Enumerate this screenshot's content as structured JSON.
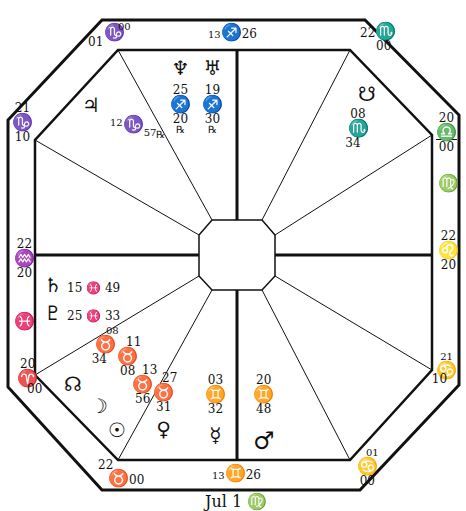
{
  "chart": {
    "colors": {
      "ink": "#111111",
      "paper": "#ffffff"
    }
  },
  "cusps": {
    "mc": {
      "deg": "13",
      "sign": "♐",
      "min": "26"
    },
    "ic": {
      "deg": "13",
      "sign": "♊",
      "min": "26"
    },
    "asc": {
      "deg": "22",
      "sign": "♒",
      "min": "20"
    },
    "desc": {
      "deg": "22",
      "sign": "♌",
      "min": "20"
    },
    "h11": {
      "deg": "00",
      "sign": "♑",
      "min": "01"
    },
    "h12": {
      "deg": "21",
      "sign": "♑",
      "min": "10"
    },
    "h9": {
      "deg": "22",
      "sign": "♏",
      "min": "00"
    },
    "h8": {
      "deg": "20",
      "sign": "♎",
      "min": "00"
    },
    "h7_side": {
      "sign": "♍"
    },
    "h6": {
      "deg": "21",
      "sign": "♋",
      "min": "10"
    },
    "h5": {
      "deg": "01",
      "sign": "♋",
      "min": "00"
    },
    "h3": {
      "deg": "22",
      "sign": "♉",
      "min": "00"
    },
    "h2": {
      "deg": "20",
      "sign": "♈",
      "min": "00"
    },
    "h1_side": {
      "sign": "♓"
    }
  },
  "planets": {
    "neptune": {
      "glyph": "♆",
      "deg": "25",
      "sign": "♐",
      "min": "20",
      "retro": "℞"
    },
    "uranus": {
      "glyph": "♅",
      "deg": "19",
      "sign": "♐",
      "min": "30",
      "retro": "℞"
    },
    "jupiter": {
      "glyph": "♃",
      "deg": "12",
      "sign": "♑",
      "min": "57",
      "retro": "℞"
    },
    "south_node": {
      "glyph": "☋",
      "deg": "08",
      "sign": "♏",
      "min": "34"
    },
    "saturn": {
      "glyph": "♄",
      "text": "15 ♓ 49"
    },
    "pluto": {
      "glyph": "♇",
      "text": "25 ♓ 33"
    },
    "north_node": {
      "glyph": "☊"
    },
    "moon": {
      "glyph": "☽",
      "deg": "08",
      "sign": "♉",
      "min": "34"
    },
    "sun": {
      "glyph": "☉",
      "deg": "11",
      "sign": "♉",
      "min": "08"
    },
    "sun2": {
      "deg": "13",
      "sign": "♉",
      "min": "56"
    },
    "venus": {
      "glyph": "♀",
      "deg": "27",
      "sign": "♉",
      "min": "31"
    },
    "mercury": {
      "glyph": "☿",
      "deg": "03",
      "sign": "♊",
      "min": "32"
    },
    "mars": {
      "glyph": "♂",
      "deg": "20",
      "sign": "♊",
      "min": "48"
    }
  },
  "caption": "Jul 1 ♍"
}
